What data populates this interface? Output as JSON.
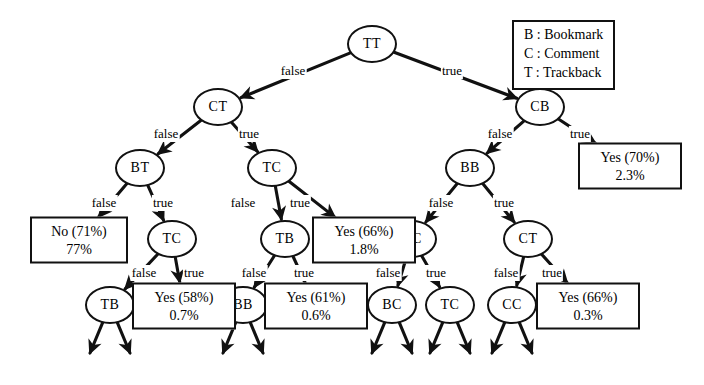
{
  "diagram": {
    "legend": {
      "name": "legend-box",
      "entries": [
        "B : Bookmark",
        "C : Comment",
        "T : Trackback"
      ]
    },
    "edge_label_false": "false",
    "edge_label_true": "true",
    "nodes": [
      {
        "id": "TT",
        "label": "TT",
        "x": 372,
        "y": 44
      },
      {
        "id": "CT",
        "label": "CT",
        "x": 218,
        "y": 107
      },
      {
        "id": "CB",
        "label": "CB",
        "x": 540,
        "y": 107
      },
      {
        "id": "BT",
        "label": "BT",
        "x": 140,
        "y": 168
      },
      {
        "id": "TC_1",
        "label": "TC",
        "x": 272,
        "y": 168
      },
      {
        "id": "BB_1",
        "label": "BB",
        "x": 470,
        "y": 168
      },
      {
        "id": "TC_2",
        "label": "TC",
        "x": 172,
        "y": 239
      },
      {
        "id": "TB_1",
        "label": "TB",
        "x": 285,
        "y": 239
      },
      {
        "id": "CC_1",
        "label": "CC",
        "x": 412,
        "y": 239
      },
      {
        "id": "CT_2",
        "label": "CT",
        "x": 528,
        "y": 239
      },
      {
        "id": "TB_2",
        "label": "TB",
        "x": 110,
        "y": 305
      },
      {
        "id": "BB_2",
        "label": "BB",
        "x": 243,
        "y": 305
      },
      {
        "id": "BC",
        "label": "BC",
        "x": 392,
        "y": 305
      },
      {
        "id": "TC_3",
        "label": "TC",
        "x": 450,
        "y": 305
      },
      {
        "id": "CC_2",
        "label": "CC",
        "x": 512,
        "y": 305
      }
    ],
    "leaves": [
      {
        "id": "leaf-no-71",
        "line1": "No (71%)",
        "line2": "77%",
        "x": 79,
        "y": 240,
        "w": 78
      },
      {
        "id": "leaf-yes-70",
        "line1": "Yes (70%)",
        "line2": "2.3%",
        "x": 630,
        "y": 166,
        "w": 84
      },
      {
        "id": "leaf-yes-66a",
        "line1": "Yes (66%)",
        "line2": "1.8%",
        "x": 364,
        "y": 240,
        "w": 84
      },
      {
        "id": "leaf-yes-58",
        "line1": "Yes (58%)",
        "line2": "0.7%",
        "x": 184,
        "y": 306,
        "w": 84
      },
      {
        "id": "leaf-yes-61",
        "line1": "Yes (61%)",
        "line2": "0.6%",
        "x": 316,
        "y": 306,
        "w": 84
      },
      {
        "id": "leaf-yes-66b",
        "line1": "Yes (66%)",
        "line2": "0.3%",
        "x": 588,
        "y": 306,
        "w": 84
      }
    ],
    "edges": [
      {
        "from": "TT",
        "to": "CT",
        "branch": "false",
        "lx": 293,
        "ly": 71
      },
      {
        "from": "TT",
        "to": "CB",
        "branch": "true",
        "lx": 452,
        "ly": 71
      },
      {
        "from": "CT",
        "to": "BT",
        "branch": "false",
        "lx": 166,
        "ly": 134
      },
      {
        "from": "CT",
        "to": "TC_1",
        "branch": "true",
        "lx": 249,
        "ly": 134
      },
      {
        "from": "CB",
        "to": "BB_1",
        "branch": "false",
        "lx": 500,
        "ly": 134
      },
      {
        "from": "CB",
        "to": "leaf-yes-70",
        "branch": "true",
        "lx": 580,
        "ly": 134
      },
      {
        "from": "BT",
        "to": "leaf-no-71",
        "branch": "false",
        "lx": 104,
        "ly": 203
      },
      {
        "from": "BT",
        "to": "TC_2",
        "branch": "true",
        "lx": 163,
        "ly": 203
      },
      {
        "from": "TC_1",
        "to": "TB_1",
        "branch": "false",
        "lx": 243,
        "ly": 203
      },
      {
        "from": "TC_1",
        "to": "leaf-yes-66a",
        "branch": "true",
        "lx": 300,
        "ly": 203
      },
      {
        "from": "BB_1",
        "to": "CC_1",
        "branch": "false",
        "lx": 441,
        "ly": 203
      },
      {
        "from": "BB_1",
        "to": "CT_2",
        "branch": "true",
        "lx": 504,
        "ly": 203
      },
      {
        "from": "TC_2",
        "to": "TB_2",
        "branch": "false",
        "lx": 144,
        "ly": 273
      },
      {
        "from": "TC_2",
        "to": "leaf-yes-58",
        "branch": "true",
        "lx": 194,
        "ly": 273
      },
      {
        "from": "TB_1",
        "to": "BB_2",
        "branch": "false",
        "lx": 254,
        "ly": 273
      },
      {
        "from": "TB_1",
        "to": "leaf-yes-61",
        "branch": "true",
        "lx": 304,
        "ly": 273
      },
      {
        "from": "CC_1",
        "to": "BC",
        "branch": "false",
        "lx": 388,
        "ly": 273
      },
      {
        "from": "CC_1",
        "to": "TC_3",
        "branch": "true",
        "lx": 436,
        "ly": 273
      },
      {
        "from": "CT_2",
        "to": "CC_2",
        "branch": "false",
        "lx": 506,
        "ly": 273
      },
      {
        "from": "CT_2",
        "to": "leaf-yes-66b",
        "branch": "true",
        "lx": 552,
        "ly": 273
      }
    ],
    "dangling_parents": [
      "TB_2",
      "BB_2",
      "BC",
      "TC_3",
      "CC_2"
    ]
  }
}
